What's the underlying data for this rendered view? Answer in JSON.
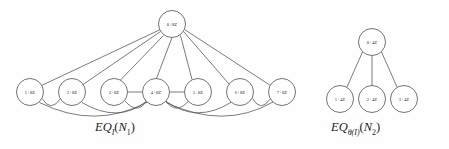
{
  "figure": {
    "type": "graph-diagram",
    "background_color": "#fefefe",
    "stroke_color": "#5a5a5a",
    "label_color": "#2a2a2a",
    "graphs": [
      {
        "id": "left-graph",
        "caption": {
          "prefix": "EQ",
          "subscript": "I",
          "argument_open": "(",
          "argument": "N",
          "argument_subscript": "1",
          "argument_close": ")",
          "full_text": "EQ_I(N_1)"
        },
        "top_node": {
          "label": "0+8Z",
          "cx": 172,
          "cy": 24,
          "r": 13.5
        },
        "bottom_nodes": [
          {
            "label": "1+8Z",
            "cx": 30,
            "cy": 92,
            "r": 13.5
          },
          {
            "label": "2+8Z",
            "cx": 72,
            "cy": 92,
            "r": 13.5
          },
          {
            "label": "3+8Z",
            "cx": 114,
            "cy": 92,
            "r": 13.5
          },
          {
            "label": "4+8Z",
            "cx": 156,
            "cy": 92,
            "r": 13.5
          },
          {
            "label": "5+8Z",
            "cx": 198,
            "cy": 92,
            "r": 13.5
          },
          {
            "label": "6+8Z",
            "cx": 240,
            "cy": 92,
            "r": 13.5
          },
          {
            "label": "7+8Z",
            "cx": 282,
            "cy": 92,
            "r": 13.5
          }
        ],
        "straight_edges": [
          [
            "0+8Z",
            "1+8Z"
          ],
          [
            "0+8Z",
            "2+8Z"
          ],
          [
            "0+8Z",
            "3+8Z"
          ],
          [
            "0+8Z",
            "4+8Z"
          ],
          [
            "0+8Z",
            "5+8Z"
          ],
          [
            "0+8Z",
            "6+8Z"
          ],
          [
            "0+8Z",
            "7+8Z"
          ],
          [
            "3+8Z",
            "4+8Z"
          ],
          [
            "4+8Z",
            "5+8Z"
          ]
        ],
        "arc_edges": [
          [
            "1+8Z",
            "2+8Z"
          ],
          [
            "1+8Z",
            "4+8Z"
          ],
          [
            "2+8Z",
            "4+8Z"
          ],
          [
            "3+8Z",
            "4+8Z"
          ],
          [
            "4+8Z",
            "5+8Z"
          ],
          [
            "4+8Z",
            "6+8Z"
          ],
          [
            "4+8Z",
            "7+8Z"
          ],
          [
            "6+8Z",
            "7+8Z"
          ]
        ]
      },
      {
        "id": "right-graph",
        "caption": {
          "prefix": "EQ",
          "subscript": "θ(I)",
          "argument_open": "(",
          "argument": "N",
          "argument_subscript": "2",
          "argument_close": ")",
          "full_text": "EQ_θ(I)(N_2)"
        },
        "top_node": {
          "label": "0+4Z",
          "cx": 372,
          "cy": 42,
          "r": 13.5
        },
        "bottom_nodes": [
          {
            "label": "1+4Z",
            "cx": 340,
            "cy": 99,
            "r": 13.5
          },
          {
            "label": "2+4Z",
            "cx": 372,
            "cy": 99,
            "r": 13.5
          },
          {
            "label": "3+4Z",
            "cx": 404,
            "cy": 99,
            "r": 13.5
          }
        ],
        "straight_edges": [
          [
            "0+4Z",
            "1+4Z"
          ],
          [
            "0+4Z",
            "2+4Z"
          ],
          [
            "0+4Z",
            "3+4Z"
          ]
        ],
        "arc_edges": []
      }
    ]
  }
}
